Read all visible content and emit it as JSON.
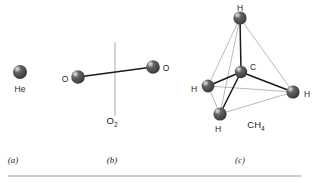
{
  "figure": {
    "background": "#ffffff",
    "ink_color": "#231f20",
    "panels": [
      {
        "key": "a",
        "caption": "(a)",
        "caption_x": 13,
        "caption_y": 163,
        "species": "He",
        "formula": null,
        "atoms": [
          {
            "element": "He",
            "label": "He",
            "x": 20,
            "y": 72,
            "r": 7.0,
            "label_x": 20,
            "label_y": 90,
            "label_anchor": "middle"
          }
        ],
        "bonds": [],
        "axis": null
      },
      {
        "key": "b",
        "caption": "(b)",
        "caption_x": 112,
        "caption_y": 163,
        "species": "Oxygen molecule",
        "formula": {
          "base": "O",
          "sub": "2",
          "x": 112,
          "y": 124
        },
        "atoms": [
          {
            "element": "O",
            "label": "O",
            "x": 78,
            "y": 77,
            "r": 6.8,
            "label_x": 65,
            "label_y": 80,
            "label_anchor": "middle"
          },
          {
            "element": "O",
            "label": "O",
            "x": 153,
            "y": 67,
            "r": 6.8,
            "label_x": 166,
            "label_y": 69,
            "label_anchor": "middle"
          }
        ],
        "bonds": [
          {
            "from": 0,
            "to": 1,
            "style": "strong"
          }
        ],
        "axis": {
          "x": 115,
          "y1": 42,
          "y2": 116
        }
      },
      {
        "key": "c",
        "caption": "(c)",
        "caption_x": 240,
        "caption_y": 163,
        "species": "Methane",
        "formula": {
          "base": "CH",
          "sub": "4",
          "x": 256,
          "y": 128
        },
        "atoms": [
          {
            "element": "H",
            "label": "H",
            "x": 240,
            "y": 18,
            "r": 6.6,
            "label_x": 240,
            "label_y": 9,
            "label_anchor": "middle"
          },
          {
            "element": "C",
            "label": "C",
            "x": 241,
            "y": 72,
            "r": 6.2,
            "label_x": 253,
            "label_y": 68,
            "label_anchor": "middle"
          },
          {
            "element": "H",
            "label": "H",
            "x": 208,
            "y": 86,
            "r": 6.4,
            "label_x": 194,
            "label_y": 90,
            "label_anchor": "middle"
          },
          {
            "element": "H",
            "label": "H",
            "x": 293,
            "y": 92,
            "r": 6.6,
            "label_x": 307,
            "label_y": 95,
            "label_anchor": "middle"
          },
          {
            "element": "H",
            "label": "H",
            "x": 220,
            "y": 114,
            "r": 6.6,
            "label_x": 218,
            "label_y": 130,
            "label_anchor": "middle"
          }
        ],
        "bonds": [
          {
            "from": 1,
            "to": 0,
            "style": "strong"
          },
          {
            "from": 1,
            "to": 2,
            "style": "strong"
          },
          {
            "from": 1,
            "to": 3,
            "style": "strong"
          },
          {
            "from": 1,
            "to": 4,
            "style": "strong"
          }
        ],
        "edges": [
          {
            "from": 0,
            "to": 2,
            "style": "thin"
          },
          {
            "from": 0,
            "to": 3,
            "style": "thin"
          },
          {
            "from": 0,
            "to": 4,
            "style": "thin"
          },
          {
            "from": 2,
            "to": 3,
            "style": "thin"
          },
          {
            "from": 2,
            "to": 4,
            "style": "thin"
          },
          {
            "from": 3,
            "to": 4,
            "style": "thin"
          }
        ],
        "axis": null
      }
    ],
    "rule": {
      "x1": 8,
      "y1": 176,
      "x2": 301,
      "y2": 176
    }
  }
}
